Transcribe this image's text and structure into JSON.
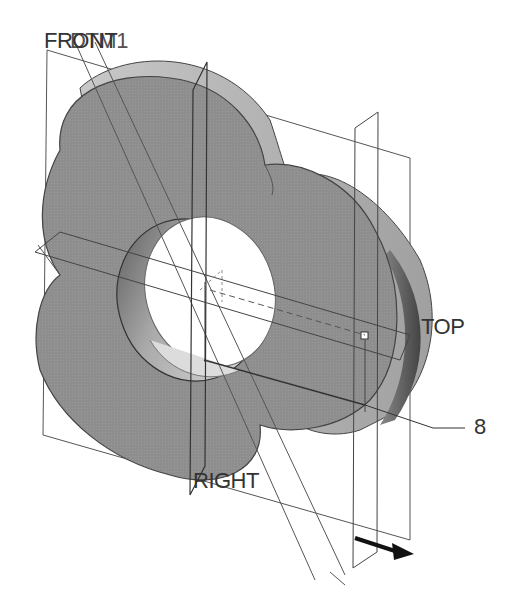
{
  "figure": {
    "type": "CAD isometric part drawing",
    "part": "three-lobed disc with central through-hole",
    "colors": {
      "background": "#ffffff",
      "part_face": "#8f8f8f",
      "part_side": "#b8b8b8",
      "hole_inner": "#d0d0d0",
      "lines": "#444444"
    }
  },
  "labels": {
    "datum_front": "FRONT",
    "datum_dtm1": "DTM1",
    "datum_top": "TOP",
    "datum_right": "RIGHT",
    "callout_number": "8"
  },
  "icons": {
    "direction_arrow": "arrow-right-down"
  }
}
